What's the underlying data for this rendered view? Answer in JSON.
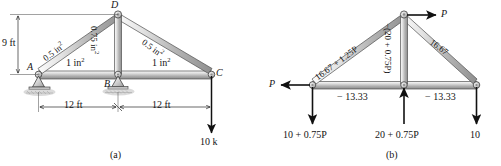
{
  "figure": {
    "captions": {
      "left": "(a)",
      "right": "(b)"
    }
  },
  "diagram_a": {
    "joints": {
      "a": "A",
      "b": "B",
      "c": "C",
      "d": "D"
    },
    "member_areas": {
      "left_top": "0.5 in",
      "left_top_sup": "2",
      "right_top": "0.5 in",
      "right_top_sup": "2",
      "vertical": "0.75 in",
      "vertical_sup": "2",
      "bottom_left": "1 in",
      "bottom_left_sup": "2",
      "bottom_right": "1 in",
      "bottom_right_sup": "2"
    },
    "dimensions": {
      "height": "9 ft",
      "span_left": "12 ft",
      "span_right": "12 ft"
    },
    "loads": {
      "tip_load": "10 k"
    },
    "supports": {
      "left": "pin-support",
      "middle": "roller-support"
    }
  },
  "diagram_b": {
    "member_forces": {
      "left_top": "16.67 + 1.25P",
      "right_top": "16.67",
      "vertical": "−(20 + 0.75P)",
      "bottom_left": "− 13.33",
      "bottom_right": "− 13.33"
    },
    "applied_loads": {
      "apex_right": "P",
      "left_joint": "P",
      "left_reaction": "10 + 0.75P",
      "mid_reaction": "20 + 0.75P",
      "right_load": "10"
    }
  },
  "colors": {
    "member_fill_light": "#f2f2f2",
    "member_fill_mid": "#c9c9c9",
    "member_fill_dark": "#9a9a9a",
    "outline": "#4a4a4a",
    "arrow": "#111111",
    "text": "#151515",
    "ground_hatch": "#8c8c8c"
  }
}
